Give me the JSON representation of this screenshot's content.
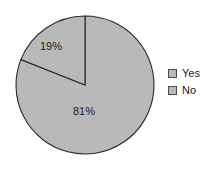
{
  "chart_data": {
    "type": "pie",
    "title": "",
    "subtitle": "",
    "xlabel": "",
    "ylabel": "",
    "grid": false,
    "legend_position": "right",
    "start_angle_deg": 90,
    "direction": "counterclockwise",
    "categories": [
      "Yes",
      "No"
    ],
    "values": [
      19,
      81
    ],
    "value_unit": "%",
    "data_labels": [
      "19%",
      "81%"
    ],
    "slices": [
      {
        "name": "Yes",
        "value": 19,
        "label": "19%",
        "color": "#b9b9b9",
        "edge_color": "#2b2b2b"
      },
      {
        "name": "No",
        "value": 81,
        "label": "81%",
        "color": "#b9b9b9",
        "edge_color": "#2b2b2b"
      }
    ],
    "legend": [
      {
        "label": "Yes",
        "swatch_color": "#b9b9b9"
      },
      {
        "label": "No",
        "swatch_color": "#b9b9b9"
      }
    ],
    "background_color": "#ffffff"
  },
  "geometry": {
    "center_x": 85,
    "center_y": 85,
    "radius": 69
  }
}
